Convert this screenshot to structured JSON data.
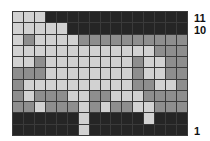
{
  "colors": {
    "L": "#d2d2d2",
    "M": "#8e8e8e",
    "D": "#252525"
  },
  "grid": {
    "columns": 16,
    "rows_top_to_bottom": [
      {
        "row": 11,
        "cells": "LLLDDDDDDDDDDDDD"
      },
      {
        "row": 10,
        "cells": "LLLLLDDDDDDDDDDD"
      },
      {
        "row": 9,
        "cells": "LMLLLLMMMMMMMMMM"
      },
      {
        "row": 8,
        "cells": "LLLLLLLLLLLLLMMM"
      },
      {
        "row": 7,
        "cells": "LLMLLLLLLLLMLLMM"
      },
      {
        "row": 6,
        "cells": "MMMLLLLLLLLMLLMM"
      },
      {
        "row": 5,
        "cells": "MLLLLLLLLLLMMLLM"
      },
      {
        "row": 4,
        "cells": "MLMMMLLMMLLLMMMM"
      },
      {
        "row": 3,
        "cells": "MMLMMMLMLMMLLMMM"
      },
      {
        "row": 2,
        "cells": "DDDDDDLDDDDDLDDD"
      },
      {
        "row": 1,
        "cells": "DDDDDDLDDDDDDDDD"
      }
    ]
  },
  "labels": {
    "row_11": "11",
    "row_10": "10",
    "row_1": "1"
  }
}
